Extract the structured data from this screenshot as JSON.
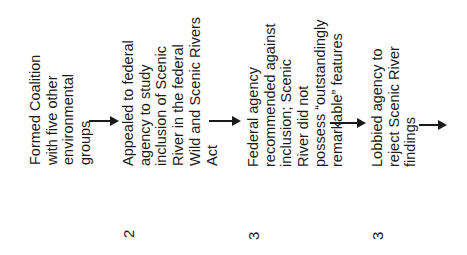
{
  "diagram": {
    "type": "flowchart",
    "orientation": "rotated-90-ccw",
    "steps": [
      {
        "id": 1,
        "lines": [
          "Formed Coalition",
          "with five other",
          "environmental",
          "groups"
        ],
        "number": ""
      },
      {
        "id": 2,
        "lines": [
          "Appealed to federal",
          "agency to study",
          "inclusion of Scenic",
          "River in the federal",
          "Wild and Scenic Rivers",
          "Act"
        ],
        "number": "2"
      },
      {
        "id": 3,
        "lines": [
          "Federal agency",
          "recommended against",
          "inclusion; Scenic",
          "River did not",
          "possess “outstandingly",
          "remarkable” features"
        ],
        "number": "3"
      },
      {
        "id": 4,
        "lines": [
          "Lobbied agency to",
          "reject Scenic River",
          "findings"
        ],
        "number": "3"
      }
    ],
    "arrows": [
      {
        "from": 1,
        "to": 2
      },
      {
        "from": 2,
        "to": 3
      },
      {
        "from": 3,
        "to": 4
      },
      {
        "from": 4,
        "to": "next"
      }
    ]
  }
}
